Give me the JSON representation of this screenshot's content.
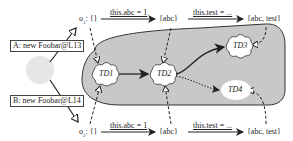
{
  "diagram": {
    "allocations": [
      {
        "id": "A",
        "label": "A: new Foobar@L13"
      },
      {
        "id": "B",
        "label": "B: new Foobar@L14"
      }
    ],
    "objects": {
      "o1": {
        "name": "o",
        "sub": "1",
        "init": ": {}"
      },
      "o2": {
        "name": "o",
        "sub": "2",
        "init": ": {}"
      }
    },
    "transitions_top": [
      {
        "label": "this.abc = 1",
        "result": "{abc}"
      },
      {
        "label": "this.test = ...",
        "result": "{abc, test}"
      }
    ],
    "transitions_bottom": [
      {
        "label": "this.abc = 1",
        "result": "{abc}"
      },
      {
        "label": "this.test = ...",
        "result": "{abc, test}"
      }
    ],
    "type_descriptors": [
      "TD1",
      "TD2",
      "TD3",
      "TD4"
    ],
    "colors": {
      "region_fill": "#c8c8c8",
      "region_stroke": "#333333",
      "circle_fill": "#e6e6e6",
      "cloud_fill": "#ffffff",
      "arrow": "#222222"
    }
  }
}
